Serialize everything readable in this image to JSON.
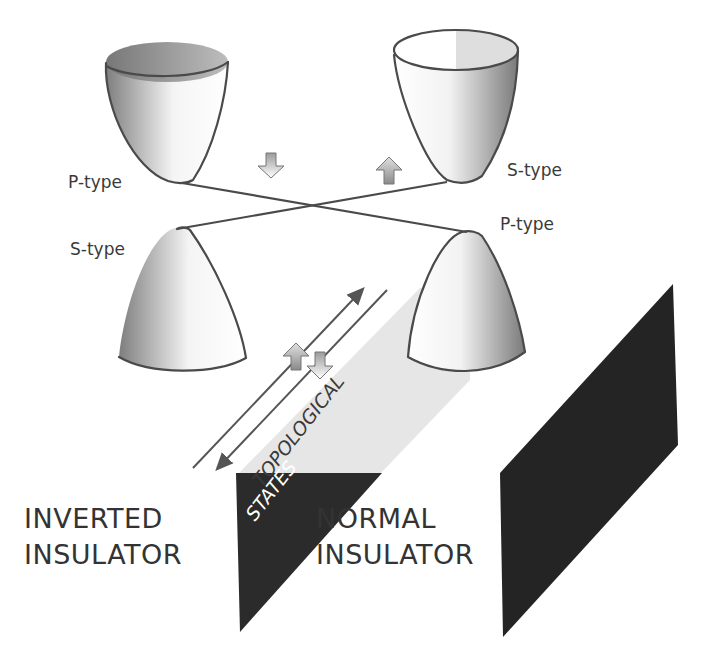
{
  "diagram": {
    "band_labels": {
      "top_left_cone": "P-type",
      "top_right_cone": "S-type",
      "bottom_left_cone": "S-type",
      "bottom_right_cone": "P-type"
    },
    "regions": {
      "left_line1": "INVERTED",
      "left_line2": "INSULATOR",
      "middle_line1": "NORMAL",
      "middle_line2": "INSULATOR"
    },
    "surface_label": {
      "line1": "TOPOLOGICAL",
      "line2": "STATES"
    },
    "spin_arrows": [
      {
        "position": "between top cones, left",
        "direction": "down",
        "style": "white"
      },
      {
        "position": "between top cones, right",
        "direction": "up",
        "style": "shaded"
      },
      {
        "position": "on surface channel, left",
        "direction": "up",
        "style": "shaded"
      },
      {
        "position": "on surface channel, right",
        "direction": "down",
        "style": "white"
      }
    ],
    "propagation_arrows": [
      {
        "direction": "up-right"
      },
      {
        "direction": "down-left"
      }
    ],
    "colors": {
      "background": "#ffffff",
      "outline": "#4a4a4a",
      "dark_block": "#2b2b2b",
      "surface_band": "#e6e6e6",
      "text": "#333333"
    }
  }
}
